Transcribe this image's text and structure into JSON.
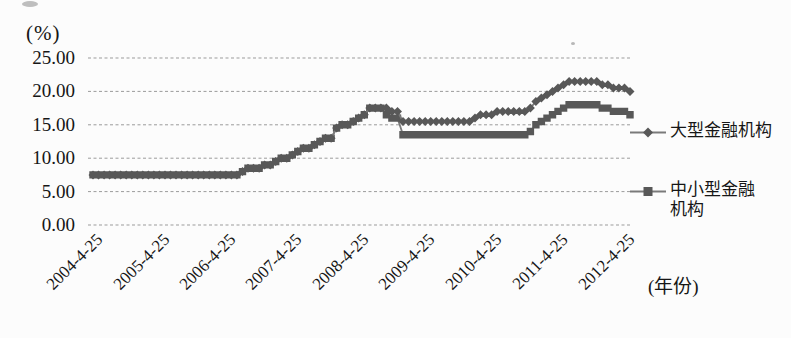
{
  "chart_data": {
    "type": "line",
    "title": "",
    "y_axis": {
      "unit_label": "(%)",
      "ticks": [
        "25.00",
        "20.00",
        "15.00",
        "10.00",
        "5.00",
        "0.00"
      ],
      "min": 0,
      "max": 25,
      "gridlines": "dashed-horizontal"
    },
    "x_axis": {
      "unit_label": "(年份)",
      "ticks": [
        "2004-4-25",
        "2005-4-25",
        "2006-4-25",
        "2007-4-25",
        "2008-4-25",
        "2009-4-25",
        "2010-4-25",
        "2011-4-25",
        "2012-4-25"
      ],
      "tick_label_rotation_deg": -45
    },
    "x_start": "2004-04-25",
    "x_interval": "monthly",
    "x_sample_day": 25,
    "legend_position": "right",
    "style": {
      "grid_color": "#9b9b9b",
      "text_color": "#161616",
      "background": "#fcfcfc"
    },
    "series": [
      {
        "name": "大型金融机构",
        "marker": "diamond",
        "line_color": "#7a7a7a",
        "marker_color": "#585858",
        "values": [
          7.5,
          7.5,
          7.5,
          7.5,
          7.5,
          7.5,
          7.5,
          7.5,
          7.5,
          7.5,
          7.5,
          7.5,
          7.5,
          7.5,
          7.5,
          7.5,
          7.5,
          7.5,
          7.5,
          7.5,
          7.5,
          7.5,
          7.5,
          7.5,
          7.5,
          7.5,
          7.5,
          8.0,
          8.5,
          8.5,
          8.5,
          9.0,
          9.0,
          9.5,
          10.0,
          10.0,
          10.5,
          11.0,
          11.5,
          11.5,
          12.0,
          12.5,
          13.0,
          13.0,
          14.5,
          15.0,
          15.0,
          15.5,
          16.0,
          16.5,
          17.5,
          17.5,
          17.5,
          17.5,
          17.0,
          17.0,
          15.5,
          15.5,
          15.5,
          15.5,
          15.5,
          15.5,
          15.5,
          15.5,
          15.5,
          15.5,
          15.5,
          15.5,
          15.5,
          16.0,
          16.5,
          16.5,
          16.5,
          17.0,
          17.0,
          17.0,
          17.0,
          17.0,
          17.0,
          17.5,
          18.5,
          19.0,
          19.5,
          20.0,
          20.5,
          21.0,
          21.5,
          21.5,
          21.5,
          21.5,
          21.5,
          21.5,
          21.0,
          21.0,
          20.5,
          20.5,
          20.5,
          20.0
        ]
      },
      {
        "name": "中小型金融机构",
        "marker": "square",
        "line_color": "#7a7a7a",
        "marker_color": "#585858",
        "values": [
          7.5,
          7.5,
          7.5,
          7.5,
          7.5,
          7.5,
          7.5,
          7.5,
          7.5,
          7.5,
          7.5,
          7.5,
          7.5,
          7.5,
          7.5,
          7.5,
          7.5,
          7.5,
          7.5,
          7.5,
          7.5,
          7.5,
          7.5,
          7.5,
          7.5,
          7.5,
          7.5,
          8.0,
          8.5,
          8.5,
          8.5,
          9.0,
          9.0,
          9.5,
          10.0,
          10.0,
          10.5,
          11.0,
          11.5,
          11.5,
          12.0,
          12.5,
          13.0,
          13.0,
          14.5,
          15.0,
          15.0,
          15.5,
          16.0,
          16.5,
          17.5,
          17.5,
          17.5,
          16.5,
          16.0,
          16.0,
          13.5,
          13.5,
          13.5,
          13.5,
          13.5,
          13.5,
          13.5,
          13.5,
          13.5,
          13.5,
          13.5,
          13.5,
          13.5,
          13.5,
          13.5,
          13.5,
          13.5,
          13.5,
          13.5,
          13.5,
          13.5,
          13.5,
          13.5,
          14.0,
          15.0,
          15.5,
          16.0,
          16.5,
          17.0,
          17.5,
          18.0,
          18.0,
          18.0,
          18.0,
          18.0,
          18.0,
          17.5,
          17.5,
          17.0,
          17.0,
          17.0,
          16.5
        ]
      }
    ]
  }
}
